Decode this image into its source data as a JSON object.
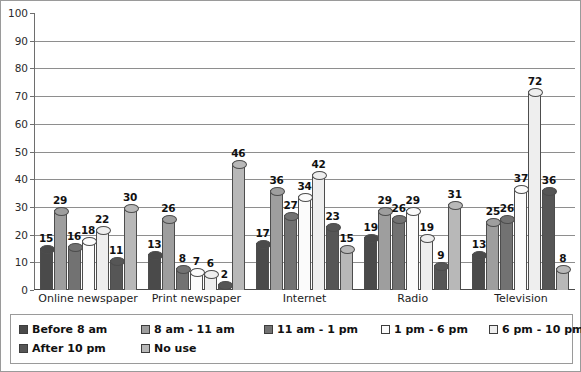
{
  "chart_data": {
    "type": "bar",
    "title": "",
    "subtitle": "",
    "xlabel": "",
    "ylabel": "",
    "ylim": [
      0,
      100
    ],
    "ytick_step": 10,
    "yticks": [
      0,
      10,
      20,
      30,
      40,
      50,
      60,
      70,
      80,
      90,
      100
    ],
    "grid": true,
    "legend_position": "bottom",
    "categories": [
      "Online newspaper",
      "Print newspaper",
      "Internet",
      "Radio",
      "Television"
    ],
    "series": [
      {
        "name": "Before 8 am",
        "color": "#4a4a4a",
        "values": [
          15,
          13,
          17,
          19,
          13
        ]
      },
      {
        "name": "8 am - 11 am",
        "color": "#9e9e9e",
        "values": [
          29,
          26,
          36,
          29,
          25
        ]
      },
      {
        "name": "11 am - 1 pm",
        "color": "#727272",
        "values": [
          16,
          8,
          27,
          26,
          26
        ]
      },
      {
        "name": "1 pm - 6 pm",
        "color": "#fbfbfb",
        "values": [
          18,
          7,
          34,
          29,
          37
        ]
      },
      {
        "name": "6 pm - 10 pm",
        "color": "#eeeeee",
        "values": [
          22,
          6,
          42,
          19,
          72
        ]
      },
      {
        "name": "After 10 pm",
        "color": "#565656",
        "values": [
          11,
          2,
          23,
          9,
          36
        ]
      },
      {
        "name": "No use",
        "color": "#b8b8b8",
        "values": [
          30,
          46,
          15,
          31,
          8
        ]
      }
    ]
  },
  "legend": {
    "rows": [
      [
        "Before 8 am",
        "8 am - 11 am",
        "11 am - 1 pm",
        "1 pm - 6 pm",
        "6 pm - 10 pm"
      ],
      [
        "After 10 pm",
        "No use"
      ]
    ]
  },
  "colors": {
    "axis": "#4a4a4a",
    "gridline": "#8e8e8e",
    "border": "#9a9a9a",
    "text": "#111111",
    "background": "#ffffff"
  }
}
